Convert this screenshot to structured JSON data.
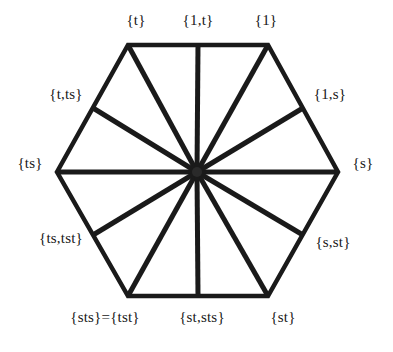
{
  "figure": {
    "type": "hexagon-spoke-diagram",
    "title": "",
    "shape": "hexagon",
    "spoke_count": 12,
    "colors": {
      "background": "#ffffff",
      "stroke": "#1a1a1a",
      "text": "#171717"
    },
    "geometry": {
      "center": {
        "x": 197,
        "y": 172
      },
      "vertices": [
        {
          "x": 128,
          "y": 45
        },
        {
          "x": 268,
          "y": 45
        },
        {
          "x": 338,
          "y": 172
        },
        {
          "x": 268,
          "y": 296
        },
        {
          "x": 128,
          "y": 296
        },
        {
          "x": 57,
          "y": 172
        }
      ],
      "edge_points": [
        {
          "x": 198,
          "y": 45
        },
        {
          "x": 303,
          "y": 108
        },
        {
          "x": 303,
          "y": 235
        },
        {
          "x": 198,
          "y": 296
        },
        {
          "x": 93,
          "y": 235
        },
        {
          "x": 93,
          "y": 108
        }
      ]
    },
    "nodes": [
      {
        "id": "t",
        "label": "{t}",
        "x": 136,
        "y": 20,
        "anchor": "center"
      },
      {
        "id": "1t",
        "label": "{1,t}",
        "x": 198,
        "y": 20,
        "anchor": "center"
      },
      {
        "id": "1",
        "label": "{1}",
        "x": 266,
        "y": 20,
        "anchor": "center"
      },
      {
        "id": "t_ts",
        "label": "{t,ts}",
        "x": 66,
        "y": 94,
        "anchor": "center"
      },
      {
        "id": "1s",
        "label": "{1,s}",
        "x": 330,
        "y": 94,
        "anchor": "center"
      },
      {
        "id": "ts",
        "label": "{ts}",
        "x": 30,
        "y": 163,
        "anchor": "center"
      },
      {
        "id": "s",
        "label": "{s}",
        "x": 363,
        "y": 163,
        "anchor": "center"
      },
      {
        "id": "ts_tst",
        "label": "{ts,tst}",
        "x": 61,
        "y": 238,
        "anchor": "center"
      },
      {
        "id": "s_st",
        "label": "{s,st}",
        "x": 333,
        "y": 242,
        "anchor": "center"
      },
      {
        "id": "sts_tst",
        "label": "{sts}={tst}",
        "x": 105,
        "y": 317,
        "anchor": "center"
      },
      {
        "id": "st_sts",
        "label": "{st,sts}",
        "x": 202,
        "y": 317,
        "anchor": "center"
      },
      {
        "id": "st",
        "label": "{st}",
        "x": 283,
        "y": 317,
        "anchor": "center"
      }
    ]
  }
}
